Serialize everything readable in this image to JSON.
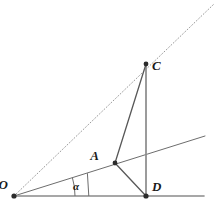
{
  "figure": {
    "width": 216,
    "height": 209,
    "background_color": "#ffffff"
  },
  "colors": {
    "stroke_primary": "#4a4a4a",
    "stroke_secondary": "#7d7d7d",
    "stroke_dotted": "#9a9a9a",
    "stroke_baseline": "#8a8a8a",
    "point_fill": "#2b2b2b",
    "label_color": "#1a1a1a"
  },
  "points": [
    {
      "id": "O",
      "label": "O",
      "x": 14,
      "y": 196,
      "label_x": 8,
      "label_y": 189,
      "dot": true,
      "dot_radius": 2.6
    },
    {
      "id": "A",
      "label": "A",
      "x": 115,
      "y": 163,
      "label_x": 99,
      "label_y": 160,
      "dot": true,
      "dot_radius": 2.4
    },
    {
      "id": "C",
      "label": "C",
      "x": 146,
      "y": 64,
      "label_x": 152,
      "label_y": 70,
      "dot": true,
      "dot_radius": 2.4
    },
    {
      "id": "D",
      "label": "D",
      "x": 146,
      "y": 196,
      "label_x": 152,
      "label_y": 191,
      "dot": true,
      "dot_radius": 2.6
    }
  ],
  "segments": [
    {
      "id": "ray-O-through-C-dotted",
      "name": "dotted-ray-OC",
      "from": [
        14,
        196
      ],
      "to": [
        214,
        4
      ],
      "style": "dotted",
      "color": "#9a9a9a",
      "width": 1.0
    },
    {
      "id": "ray-O-through-A",
      "name": "ray-OA",
      "from": [
        14,
        196
      ],
      "to": [
        205,
        136
      ],
      "style": "solid",
      "color": "#6d6d6d",
      "width": 1.0
    },
    {
      "id": "baseline-O-to-right",
      "name": "baseline-OD",
      "from": [
        14,
        196
      ],
      "to": [
        204,
        196
      ],
      "style": "solid",
      "color": "#8a8a8a",
      "width": 1.6
    },
    {
      "id": "segment-C-D",
      "name": "segment-CD",
      "from": [
        146,
        64
      ],
      "to": [
        146,
        196
      ],
      "style": "solid",
      "color": "#8a8a8a",
      "width": 1.7
    },
    {
      "id": "segment-A-C",
      "name": "segment-AC",
      "from": [
        115,
        163
      ],
      "to": [
        146,
        64
      ],
      "style": "solid",
      "color": "#585858",
      "width": 1.3
    },
    {
      "id": "segment-A-D",
      "name": "segment-AD",
      "from": [
        115,
        163
      ],
      "to": [
        146,
        196
      ],
      "style": "solid",
      "color": "#585858",
      "width": 1.3
    }
  ],
  "angle_mark": {
    "label": "α",
    "vertex": [
      14,
      196
    ],
    "radius": 61,
    "label_x": 73,
    "label_y": 190,
    "arc_path": "M 75 196 A 61 61 0 0 0 72.4 177.7",
    "tick_path": "M 88.8 196 L 87.4 173.2",
    "color": "#6d6d6d",
    "width": 1.0
  },
  "annotations": {
    "alt_text": "Geometric figure: rays from vertex O, angle alpha marked at O, point A on the lower ray, vertical segment from C down to D on the baseline, with segments AC and AD drawn."
  }
}
